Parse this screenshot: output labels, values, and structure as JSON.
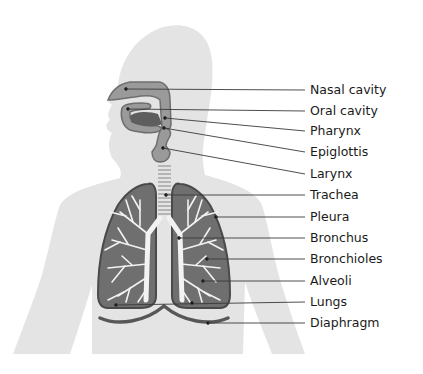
{
  "diagram": {
    "colors": {
      "body": "#e4e4e4",
      "airway": "#9a9a9a",
      "airway_outline": "#6e6e6e",
      "tongue": "#5e5e5e",
      "lung_fill": "#6f6f6f",
      "lung_outline": "#4a4a4a",
      "bronchi": "#f2f2f2",
      "diaphragm": "#575757",
      "leader": "#3a3a3a",
      "text": "#1a1a1a"
    },
    "labels": [
      {
        "text": "Nasal cavity",
        "y": 90,
        "anchor": [
          126,
          89
        ]
      },
      {
        "text": "Oral cavity",
        "y": 111,
        "anchor": [
          128,
          109
        ]
      },
      {
        "text": "Pharynx",
        "y": 131,
        "anchor": [
          165,
          118
        ]
      },
      {
        "text": "Epiglottis",
        "y": 152,
        "anchor": [
          164,
          128
        ]
      },
      {
        "text": "Larynx",
        "y": 174,
        "anchor": [
          163,
          148
        ]
      },
      {
        "text": "Trachea",
        "y": 195,
        "anchor": [
          166,
          195
        ]
      },
      {
        "text": "Pleura",
        "y": 217,
        "anchor": [
          216,
          217
        ]
      },
      {
        "text": "Bronchus",
        "y": 238,
        "anchor": [
          179,
          238
        ]
      },
      {
        "text": "Bronchioles",
        "y": 259,
        "anchor": [
          207,
          259
        ]
      },
      {
        "text": "Alveoli",
        "y": 281,
        "anchor": [
          203,
          281
        ]
      },
      {
        "text": "Lungs",
        "y": 302,
        "anchor": [
          116,
          305
        ]
      },
      {
        "text": "Diaphragm",
        "y": 323,
        "anchor": [
          208,
          323
        ]
      }
    ]
  }
}
